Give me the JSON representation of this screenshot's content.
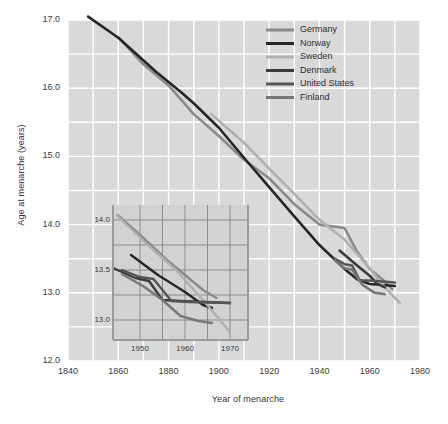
{
  "chart_data": {
    "type": "line",
    "title": "",
    "xlabel": "Year of menarche",
    "ylabel": "Age at menarche (years)",
    "xlim": [
      1840,
      1980
    ],
    "ylim": [
      12.0,
      17.0
    ],
    "xticks": [
      "1840",
      "1860",
      "1880",
      "1900",
      "1920",
      "1940",
      "1960",
      "1980"
    ],
    "yticks": [
      "12.0",
      "13.0",
      "14.0",
      "15.0",
      "16.0",
      "17.0"
    ],
    "grid": true,
    "legend_position": "top-right",
    "series": [
      {
        "name": "Germany",
        "color": "#8a8a8a",
        "points": [
          [
            1860,
            16.75
          ],
          [
            1870,
            16.35
          ],
          [
            1880,
            16.04
          ],
          [
            1890,
            15.62
          ],
          [
            1900,
            15.3
          ],
          [
            1910,
            14.95
          ],
          [
            1920,
            14.68
          ],
          [
            1930,
            14.3
          ],
          [
            1940,
            14.0
          ],
          [
            1950,
            13.95
          ],
          [
            1955,
            13.6
          ],
          [
            1960,
            13.35
          ],
          [
            1965,
            13.2
          ],
          [
            1969,
            13.05
          ]
        ]
      },
      {
        "name": "Norway",
        "color": "#262626",
        "points": [
          [
            1848,
            17.05
          ],
          [
            1860,
            16.74
          ],
          [
            1875,
            16.24
          ],
          [
            1885,
            15.94
          ],
          [
            1890,
            15.78
          ],
          [
            1900,
            15.42
          ],
          [
            1910,
            14.98
          ],
          [
            1920,
            14.55
          ],
          [
            1930,
            14.12
          ],
          [
            1940,
            13.7
          ],
          [
            1950,
            13.35
          ],
          [
            1955,
            13.2
          ],
          [
            1960,
            13.13
          ],
          [
            1970,
            13.1
          ]
        ]
      },
      {
        "name": "Sweden",
        "color": "#b0b0b0",
        "points": [
          [
            1897,
            15.62
          ],
          [
            1910,
            15.2
          ],
          [
            1920,
            14.82
          ],
          [
            1930,
            14.45
          ],
          [
            1940,
            14.07
          ],
          [
            1950,
            13.78
          ],
          [
            1960,
            13.36
          ],
          [
            1965,
            13.12
          ],
          [
            1972,
            12.85
          ]
        ]
      },
      {
        "name": "Denmark",
        "color": "#3a3a3a",
        "points": [
          [
            1948,
            13.62
          ],
          [
            1955,
            13.4
          ],
          [
            1960,
            13.25
          ],
          [
            1963,
            13.13
          ],
          [
            1966,
            13.08
          ]
        ]
      },
      {
        "name": "United States",
        "color": "#555555",
        "points": [
          [
            1946,
            13.5
          ],
          [
            1950,
            13.42
          ],
          [
            1953,
            13.4
          ],
          [
            1956,
            13.18
          ],
          [
            1960,
            13.18
          ],
          [
            1970,
            13.15
          ]
        ]
      },
      {
        "name": "Finland",
        "color": "#777777",
        "points": [
          [
            1946,
            13.48
          ],
          [
            1950,
            13.36
          ],
          [
            1953,
            13.34
          ],
          [
            1957,
            13.12
          ],
          [
            1962,
            13.0
          ],
          [
            1966,
            12.98
          ]
        ]
      }
    ],
    "inset": {
      "type": "line",
      "xlim": [
        1944,
        1974
      ],
      "ylim": [
        12.8,
        14.15
      ],
      "xticks": [
        "1950",
        "1960",
        "1970"
      ],
      "yticks": [
        "13.0",
        "13.5",
        "14.0"
      ],
      "grid": true,
      "series": [
        {
          "name": "Germany",
          "color": "#8a8a8a",
          "points": [
            [
              1945,
              14.05
            ],
            [
              1950,
              13.85
            ],
            [
              1956,
              13.6
            ],
            [
              1960,
              13.45
            ],
            [
              1964,
              13.3
            ],
            [
              1967,
              13.22
            ]
          ]
        },
        {
          "name": "Norway",
          "color": "#262626",
          "points": [
            [
              1948,
              13.65
            ],
            [
              1954,
              13.45
            ],
            [
              1960,
              13.28
            ],
            [
              1964,
              13.15
            ],
            [
              1966,
              13.12
            ]
          ]
        },
        {
          "name": "Sweden",
          "color": "#b0b0b0",
          "points": [
            [
              1945,
              14.04
            ],
            [
              1952,
              13.74
            ],
            [
              1958,
              13.5
            ],
            [
              1964,
              13.2
            ],
            [
              1970,
              12.88
            ]
          ]
        },
        {
          "name": "Denmark",
          "color": "#3a3a3a",
          "points": [
            [
              1944,
              13.52
            ],
            [
              1949,
              13.42
            ],
            [
              1952,
              13.39
            ],
            [
              1955,
              13.2
            ],
            [
              1959,
              13.19
            ],
            [
              1970,
              13.17
            ]
          ]
        },
        {
          "name": "United States",
          "color": "#555555",
          "points": [
            [
              1946,
              13.5
            ],
            [
              1950,
              13.43
            ],
            [
              1953,
              13.41
            ],
            [
              1957,
              13.19
            ],
            [
              1961,
              13.18
            ],
            [
              1970,
              13.17
            ]
          ]
        },
        {
          "name": "Finland",
          "color": "#777777",
          "points": [
            [
              1946,
              13.46
            ],
            [
              1951,
              13.33
            ],
            [
              1955,
              13.2
            ],
            [
              1959,
              13.04
            ],
            [
              1963,
              12.99
            ],
            [
              1966,
              12.97
            ]
          ]
        }
      ]
    }
  },
  "legend": {
    "items": [
      {
        "label": "Germany",
        "color": "#8a8a8a"
      },
      {
        "label": "Norway",
        "color": "#262626"
      },
      {
        "label": "Sweden",
        "color": "#b0b0b0"
      },
      {
        "label": "Denmark",
        "color": "#3a3a3a"
      },
      {
        "label": "United States",
        "color": "#555555"
      },
      {
        "label": "Finland",
        "color": "#777777"
      }
    ]
  },
  "style": {
    "plot_background": "#d9d9d9",
    "gridline_color": "#ffffff",
    "inset_background": "#d2d2d2",
    "inset_grid_color": "#8c8c8c",
    "page_background": "#ffffff"
  }
}
